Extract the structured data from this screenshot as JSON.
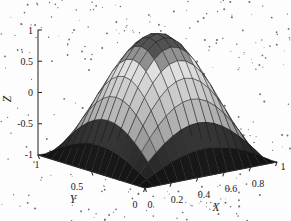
{
  "figure": {
    "kind": "matlab-surface-plot",
    "background_color": "#fdfdfd",
    "axis_color": "#2b2b2b",
    "mesh_line_color": "#20201f",
    "noise_dot_color": "#6e6e6e"
  },
  "chart_data": {
    "type": "surface",
    "title": "",
    "subtitle": "",
    "xlabel": "X",
    "ylabel": "Y",
    "zlabel": "Z",
    "xlim": [
      0,
      1
    ],
    "ylim": [
      0,
      1
    ],
    "zlim": [
      -1,
      1
    ],
    "xticks": [
      0,
      0.2,
      0.4,
      0.6,
      0.8,
      1
    ],
    "xticklabels": [
      "0",
      "0.2",
      "0.4",
      "0.6",
      "0.8",
      "1"
    ],
    "yticks": [
      0,
      0.5,
      1
    ],
    "yticklabels": [
      "0",
      "0.5",
      "1"
    ],
    "zticks": [
      -1,
      -0.5,
      0,
      0.5,
      1
    ],
    "zticklabels": [
      "-1",
      "-0.5",
      "0",
      "0.5",
      "1"
    ],
    "grid": false,
    "legend": null,
    "colormap": "gray",
    "shading": "faceted",
    "nx": 17,
    "ny": 17,
    "surface_expression": "z = sin(pi*x) * sin(pi*y) rendered as a ridge peaking near (x=0.5, y=0.5) at z=1 and falling to z=-1 along the x=0 and x=1 edges",
    "z_range_observed": [
      -1,
      1
    ],
    "peak": {
      "x": 0.5,
      "y": 0.5,
      "z": 1
    },
    "view": {
      "azimuth": -37.5,
      "elevation": 30
    }
  },
  "axes": {
    "x": {
      "label": "X",
      "ticks": [
        {
          "value": 0,
          "label": "0"
        },
        {
          "value": 0.2,
          "label": "0.2"
        },
        {
          "value": 0.4,
          "label": "0.4"
        },
        {
          "value": 0.6,
          "label": "0.6"
        },
        {
          "value": 0.8,
          "label": "0.8"
        },
        {
          "value": 1,
          "label": "1"
        }
      ]
    },
    "y": {
      "label": "Y",
      "ticks": [
        {
          "value": 1,
          "label": "1"
        },
        {
          "value": 0.5,
          "label": "0.5"
        },
        {
          "value": 0,
          "label": "0"
        }
      ]
    },
    "z": {
      "label": "Z",
      "ticks": [
        {
          "value": 1,
          "label": "1"
        },
        {
          "value": 0.5,
          "label": "0.5"
        },
        {
          "value": 0,
          "label": "0"
        },
        {
          "value": -0.5,
          "label": "-0.5"
        },
        {
          "value": -1,
          "label": "-1"
        }
      ]
    }
  },
  "caption": {
    "text": ""
  }
}
